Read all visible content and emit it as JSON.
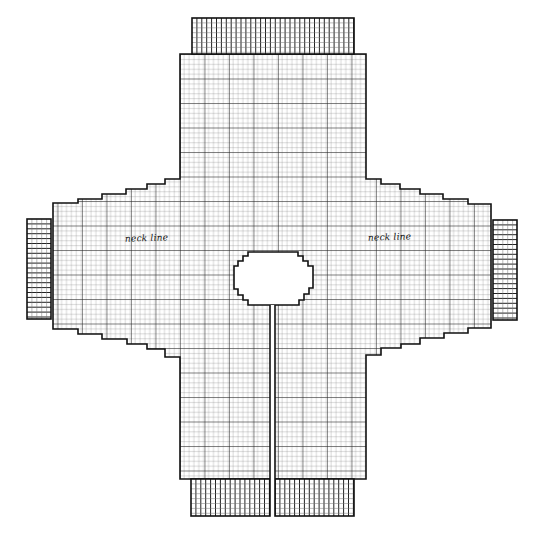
{
  "diagram": {
    "type": "knitting-pattern-schematic",
    "colors": {
      "background": "#ffffff",
      "line": "#111111",
      "minor_grid": "#555555",
      "major_grid": "#222222"
    },
    "grid": {
      "cell": 4.9,
      "major_every": 5
    },
    "labels": [
      {
        "id": "left-neck-line",
        "text": "neck line",
        "x": 125,
        "y": 239
      },
      {
        "id": "right-neck-line",
        "text": "neck line",
        "x": 368,
        "y": 238
      }
    ],
    "body_outline": [
      [
        180,
        54
      ],
      [
        366,
        54
      ],
      [
        366,
        179
      ],
      [
        381,
        179
      ],
      [
        381,
        184
      ],
      [
        400,
        184
      ],
      [
        400,
        189
      ],
      [
        420,
        189
      ],
      [
        420,
        194
      ],
      [
        443,
        194
      ],
      [
        443,
        199
      ],
      [
        468,
        199
      ],
      [
        468,
        204
      ],
      [
        491,
        204
      ],
      [
        491,
        328
      ],
      [
        468,
        328
      ],
      [
        468,
        333
      ],
      [
        444,
        333
      ],
      [
        444,
        338
      ],
      [
        420,
        338
      ],
      [
        420,
        344
      ],
      [
        401,
        344
      ],
      [
        401,
        348
      ],
      [
        381,
        348
      ],
      [
        381,
        355
      ],
      [
        366,
        355
      ],
      [
        366,
        479
      ],
      [
        180,
        479
      ],
      [
        180,
        357
      ],
      [
        165,
        357
      ],
      [
        165,
        349
      ],
      [
        147,
        349
      ],
      [
        147,
        344
      ],
      [
        127,
        344
      ],
      [
        127,
        339
      ],
      [
        102,
        339
      ],
      [
        102,
        334
      ],
      [
        78,
        334
      ],
      [
        78,
        329
      ],
      [
        53,
        329
      ],
      [
        53,
        203
      ],
      [
        78,
        203
      ],
      [
        78,
        199
      ],
      [
        102,
        199
      ],
      [
        102,
        194
      ],
      [
        126,
        194
      ],
      [
        126,
        189
      ],
      [
        147,
        189
      ],
      [
        147,
        184
      ],
      [
        165,
        184
      ],
      [
        165,
        179
      ],
      [
        180,
        179
      ]
    ],
    "neck_hole": [
      [
        252,
        252
      ],
      [
        298,
        252
      ],
      [
        298,
        256
      ],
      [
        303,
        256
      ],
      [
        303,
        261
      ],
      [
        308,
        261
      ],
      [
        308,
        266
      ],
      [
        313,
        266
      ],
      [
        313,
        288
      ],
      [
        309,
        288
      ],
      [
        309,
        294
      ],
      [
        304,
        294
      ],
      [
        304,
        300
      ],
      [
        299,
        300
      ],
      [
        299,
        305
      ],
      [
        248,
        305
      ],
      [
        248,
        300
      ],
      [
        243,
        300
      ],
      [
        243,
        295
      ],
      [
        238,
        295
      ],
      [
        238,
        289
      ],
      [
        234,
        289
      ],
      [
        234,
        266
      ],
      [
        238,
        266
      ],
      [
        238,
        261
      ],
      [
        243,
        261
      ],
      [
        243,
        256
      ],
      [
        248,
        256
      ],
      [
        248,
        252
      ]
    ],
    "center_slit": {
      "x1": 270,
      "x2": 275,
      "y_top": 305,
      "y_bottom": 516
    },
    "ribbing": [
      {
        "id": "top-ribbing",
        "x": 192,
        "y": 18,
        "w": 162,
        "h": 36,
        "orientation": "vertical"
      },
      {
        "id": "bottom-ribbing-left",
        "x": 191,
        "y": 479,
        "w": 79,
        "h": 37,
        "orientation": "vertical"
      },
      {
        "id": "bottom-ribbing-right",
        "x": 275,
        "y": 479,
        "w": 79,
        "h": 37,
        "orientation": "vertical"
      },
      {
        "id": "left-cuff",
        "x": 27,
        "y": 219,
        "w": 24,
        "h": 100,
        "orientation": "horizontal"
      },
      {
        "id": "right-cuff",
        "x": 493,
        "y": 220,
        "w": 24,
        "h": 100,
        "orientation": "horizontal"
      }
    ]
  }
}
